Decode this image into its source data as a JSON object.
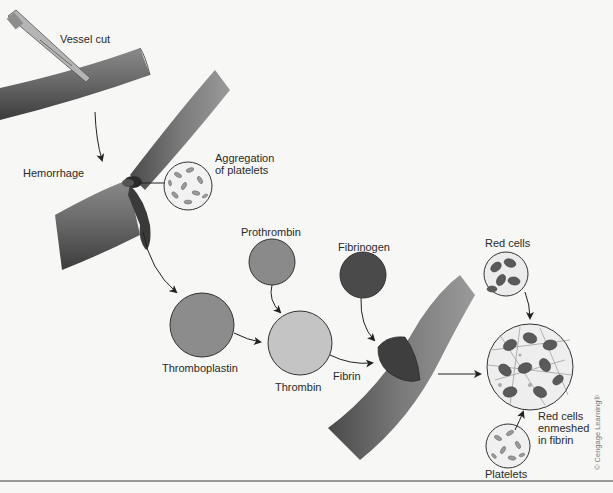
{
  "figure": {
    "labels": {
      "vessel_cut": "Vessel cut",
      "hemorrhage": "Hemorrhage",
      "aggregation": "Aggregation\nof platelets",
      "prothrombin": "Prothrombin",
      "fibrinogen": "Fibrinogen",
      "thromboplastin": "Thromboplastin",
      "thrombin": "Thrombin",
      "fibrin": "Fibrin",
      "red_cells": "Red cells",
      "red_cells_enmeshed": "Red cells\nenmeshed\nin fibrin",
      "platelets": "Platelets",
      "copyright": "© Cengage Learning®"
    },
    "colors": {
      "background": "#f7f7f5",
      "vessel": "#6e6e6e",
      "vessel_dark": "#3f3f3f",
      "clot": "#404040",
      "prothrombin": "#8a8a8a",
      "fibrinogen": "#4a4a4a",
      "thromboplastin": "#8c8c8c",
      "thrombin": "#c4c4c4",
      "red_cell": "#5a5a5a",
      "arrow": "#222222"
    },
    "flow": [
      {
        "from": "Vessel cut",
        "to": "Hemorrhage"
      },
      {
        "from": "Hemorrhage",
        "to": "Thromboplastin"
      },
      {
        "from": "Thromboplastin",
        "to": "Thrombin"
      },
      {
        "from": "Prothrombin",
        "to": "Thrombin"
      },
      {
        "from": "Thrombin",
        "to": "Fibrin"
      },
      {
        "from": "Fibrinogen",
        "to": "Fibrin"
      },
      {
        "from": "Fibrin",
        "to": "Red cells enmeshed in fibrin"
      },
      {
        "from": "Red cells",
        "to": "Red cells enmeshed in fibrin"
      },
      {
        "from": "Platelets",
        "to": "Red cells enmeshed in fibrin"
      }
    ]
  }
}
